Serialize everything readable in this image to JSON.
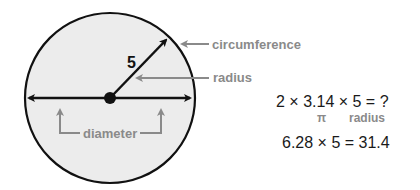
{
  "diagram": {
    "radius_value": "5",
    "labels": {
      "circumference": "circumference",
      "radius": "radius",
      "diameter": "diameter"
    },
    "equations": {
      "line1": "2 × 3.14 × 5 = ?",
      "pi_label": "π",
      "radius_label": "radius",
      "line2": "6.28 × 5 = 31.4"
    },
    "colors": {
      "circle_fill": "#ececec",
      "stroke": "#111111",
      "label_gray": "#8a8a8a"
    }
  }
}
